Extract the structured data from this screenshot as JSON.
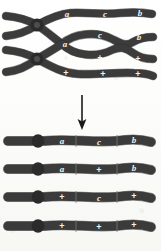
{
  "figure": {
    "background_color": "#fdfdfb",
    "chromatid_color": "#3b3b3b",
    "chromatid_outline_color": "#262626",
    "label_color": "#f2f2ef",
    "centromere_color": "#2b2b2b",
    "arrow_color": "#1a1a1a"
  },
  "upper_stage": {
    "name": "four-strand-crossover-stage",
    "chromatids": [
      {
        "id": "upper-chromatid-1",
        "role": "non-crossover-chromatid-marked",
        "markers": [
          {
            "text": "a",
            "type": "gene"
          },
          {
            "text": "c",
            "type": "gene"
          },
          {
            "text": "b",
            "type": "gene"
          }
        ]
      },
      {
        "id": "upper-chromatid-2",
        "role": "crossover-chromatid-marked",
        "markers": [
          {
            "text": "a",
            "type": "gene"
          },
          {
            "text": "c",
            "type": "gene"
          },
          {
            "text": "b",
            "type": "gene"
          }
        ]
      },
      {
        "id": "upper-chromatid-3",
        "role": "crossover-chromatid-wildtype",
        "markers": [
          {
            "text": "+",
            "type": "wildtype"
          },
          {
            "text": "+",
            "type": "wildtype"
          },
          {
            "text": "+",
            "type": "wildtype"
          }
        ]
      },
      {
        "id": "upper-chromatid-4",
        "role": "non-crossover-chromatid-wildtype",
        "markers": [
          {
            "text": "+",
            "type": "wildtype"
          },
          {
            "text": "+",
            "type": "wildtype"
          },
          {
            "text": "+",
            "type": "wildtype"
          }
        ]
      }
    ],
    "centromeres": [
      {
        "id": "centromere-upper",
        "label": ""
      },
      {
        "id": "centromere-lower",
        "label": ""
      }
    ],
    "chiasma": {
      "id": "chiasma-loop",
      "description": "exchange loop between chromatid 2 and chromatid 3"
    }
  },
  "transition": {
    "arrow": {
      "name": "downward-arrow",
      "direction": "down",
      "label": ""
    }
  },
  "lower_stage": {
    "name": "resulting-chromatids",
    "chromatids": [
      {
        "id": "product-chromatid-1",
        "type": "parental",
        "markers": [
          {
            "text": "a",
            "type": "gene"
          },
          {
            "text": "c",
            "type": "gene"
          },
          {
            "text": "b",
            "type": "gene"
          }
        ]
      },
      {
        "id": "product-chromatid-2",
        "type": "recombinant",
        "markers": [
          {
            "text": "a",
            "type": "gene"
          },
          {
            "text": "+",
            "type": "wildtype"
          },
          {
            "text": "b",
            "type": "gene"
          }
        ]
      },
      {
        "id": "product-chromatid-3",
        "type": "recombinant",
        "markers": [
          {
            "text": "+",
            "type": "wildtype"
          },
          {
            "text": "c",
            "type": "gene"
          },
          {
            "text": "+",
            "type": "wildtype"
          }
        ]
      },
      {
        "id": "product-chromatid-4",
        "type": "parental",
        "markers": [
          {
            "text": "+",
            "type": "wildtype"
          },
          {
            "text": "+",
            "type": "wildtype"
          },
          {
            "text": "+",
            "type": "wildtype"
          }
        ]
      }
    ]
  }
}
